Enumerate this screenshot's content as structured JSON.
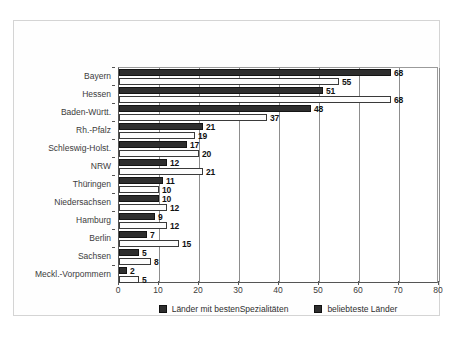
{
  "chart_data": {
    "type": "bar",
    "orientation": "horizontal",
    "title": "",
    "xlabel": "",
    "ylabel": "",
    "xlim": [
      0,
      80
    ],
    "xticks": [
      0,
      10,
      20,
      30,
      40,
      50,
      60,
      70,
      80
    ],
    "grid": true,
    "legend_position": "bottom",
    "categories": [
      "Bayern",
      "Hessen",
      "Baden-Württ.",
      "Rh.-Pfalz",
      "Schleswig-Holst.",
      "NRW",
      "Thüringen",
      "Niedersachsen",
      "Hamburg",
      "Berlin",
      "Sachsen",
      "Meckl.-Vorpommern"
    ],
    "series": [
      {
        "name": "beliebteste Länder",
        "color": "#2e2e2e",
        "style": "filled-dark",
        "values": [
          68,
          51,
          48,
          21,
          17,
          12,
          11,
          10,
          9,
          7,
          5,
          2
        ]
      },
      {
        "name": "Länder mit bestenSpezialitäten",
        "color": "#ffffff",
        "style": "outlined-white",
        "values": [
          55,
          68,
          37,
          19,
          20,
          21,
          10,
          12,
          12,
          15,
          8,
          5
        ]
      }
    ]
  },
  "legend": {
    "items": [
      {
        "label": "Länder mit bestenSpezialitäten",
        "swatch": "#2e2e2e"
      },
      {
        "label": "beliebteste Länder",
        "swatch": "#2e2e2e"
      }
    ]
  },
  "axis": {
    "x_tick_labels": [
      "0",
      "10",
      "20",
      "30",
      "40",
      "50",
      "60",
      "70",
      "80"
    ]
  }
}
